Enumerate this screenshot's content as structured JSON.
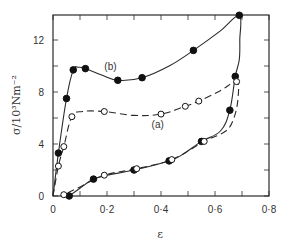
{
  "chart_data": {
    "type": "line",
    "title": "",
    "xlabel": "ε",
    "ylabel": "σ/10³Nm⁻²",
    "xlim": [
      0,
      0.8
    ],
    "ylim": [
      0,
      14
    ],
    "grid": false,
    "legend": "inline labels (a) and (b)",
    "x_ticks": [
      0,
      0.1,
      0.2,
      0.3,
      0.4,
      0.5,
      0.6,
      0.7,
      0.8
    ],
    "x_tick_labels": [
      {
        "value": 0,
        "label": "0"
      },
      {
        "value": 0.2,
        "label": "0·2"
      },
      {
        "value": 0.4,
        "label": "0·4"
      },
      {
        "value": 0.6,
        "label": "0·6"
      },
      {
        "value": 0.8,
        "label": "0·8"
      }
    ],
    "y_ticks": [
      0,
      2,
      4,
      6,
      8,
      10,
      12
    ],
    "y_tick_labels": [
      {
        "value": 0,
        "label": "0"
      },
      {
        "value": 4,
        "label": "4"
      },
      {
        "value": 8,
        "label": "8"
      },
      {
        "value": 12,
        "label": "12"
      }
    ],
    "series": [
      {
        "name": "(b)",
        "marker": "filled-circle",
        "line": "solid",
        "label_pos": [
          0.19,
          9.7
        ],
        "curve": [
          [
            0,
            0
          ],
          [
            0.02,
            3.3
          ],
          [
            0.05,
            7.5
          ],
          [
            0.075,
            9.7
          ],
          [
            0.095,
            9.9
          ],
          [
            0.12,
            9.8
          ],
          [
            0.18,
            9.3
          ],
          [
            0.24,
            8.9
          ],
          [
            0.33,
            9.1
          ],
          [
            0.43,
            10.0
          ],
          [
            0.52,
            11.2
          ],
          [
            0.62,
            12.7
          ],
          [
            0.69,
            13.9
          ],
          [
            0.692,
            12.0
          ],
          [
            0.69,
            10.5
          ],
          [
            0.675,
            9.2
          ],
          [
            0.655,
            6.6
          ],
          [
            0.62,
            5.0
          ],
          [
            0.55,
            4.2
          ],
          [
            0.48,
            3.2
          ],
          [
            0.43,
            2.7
          ],
          [
            0.3,
            2.0
          ],
          [
            0.2,
            1.6
          ],
          [
            0.15,
            1.3
          ],
          [
            0.1,
            0.6
          ],
          [
            0.06,
            0
          ]
        ],
        "points": [
          [
            0.02,
            3.3
          ],
          [
            0.05,
            7.5
          ],
          [
            0.075,
            9.7
          ],
          [
            0.12,
            9.8
          ],
          [
            0.24,
            8.9
          ],
          [
            0.33,
            9.1
          ],
          [
            0.52,
            11.2
          ],
          [
            0.69,
            13.9
          ],
          [
            0.675,
            9.2
          ],
          [
            0.655,
            6.6
          ],
          [
            0.55,
            4.2
          ],
          [
            0.43,
            2.7
          ],
          [
            0.3,
            2.0
          ],
          [
            0.15,
            1.3
          ],
          [
            0.06,
            0
          ]
        ]
      },
      {
        "name": "(a)",
        "marker": "open-circle",
        "line": "dashed",
        "label_pos": [
          0.365,
          5.2
        ],
        "curve": [
          [
            0,
            0
          ],
          [
            0.02,
            2.3
          ],
          [
            0.04,
            3.8
          ],
          [
            0.07,
            6.1
          ],
          [
            0.11,
            6.5
          ],
          [
            0.19,
            6.5
          ],
          [
            0.3,
            6.2
          ],
          [
            0.4,
            6.3
          ],
          [
            0.49,
            6.9
          ],
          [
            0.54,
            7.3
          ],
          [
            0.62,
            8.1
          ],
          [
            0.68,
            8.8
          ],
          [
            0.685,
            7.5
          ],
          [
            0.67,
            6.0
          ],
          [
            0.64,
            5.0
          ],
          [
            0.56,
            4.2
          ],
          [
            0.44,
            2.8
          ],
          [
            0.31,
            2.1
          ],
          [
            0.19,
            1.6
          ],
          [
            0.1,
            0.7
          ],
          [
            0.04,
            0.1
          ]
        ],
        "points": [
          [
            0.02,
            2.3
          ],
          [
            0.04,
            3.8
          ],
          [
            0.07,
            6.1
          ],
          [
            0.19,
            6.5
          ],
          [
            0.4,
            6.3
          ],
          [
            0.49,
            6.9
          ],
          [
            0.54,
            7.3
          ],
          [
            0.68,
            8.8
          ],
          [
            0.56,
            4.2
          ],
          [
            0.44,
            2.8
          ],
          [
            0.31,
            2.1
          ],
          [
            0.19,
            1.6
          ],
          [
            0.04,
            0.1
          ]
        ]
      }
    ]
  }
}
